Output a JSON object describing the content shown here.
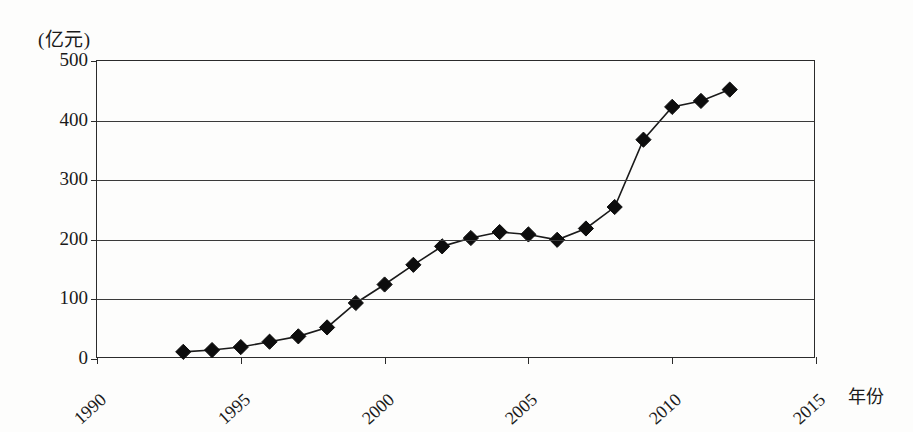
{
  "chart_data": {
    "type": "line",
    "title": "",
    "subtitle": "",
    "xlabel": "年份",
    "ylabel": "(亿元)",
    "y_unit_caption": "(亿元)",
    "xlim": [
      1990,
      2015
    ],
    "ylim": [
      0,
      500
    ],
    "grid": true,
    "legend": "none",
    "marker": "filled-diamond",
    "line_color": "#1a1a1a",
    "marker_color": "#0d0d0d",
    "x_ticks": [
      1990,
      1995,
      2000,
      2005,
      2010,
      2015
    ],
    "x_tick_labels": [
      "1990",
      "1995",
      "2000",
      "2005",
      "2010",
      "2015"
    ],
    "y_ticks": [
      0,
      100,
      200,
      300,
      400,
      500
    ],
    "y_tick_labels": [
      "0",
      "100",
      "200",
      "300",
      "400",
      "500"
    ],
    "x": [
      1993,
      1994,
      1995,
      1996,
      1997,
      1998,
      1999,
      2000,
      2001,
      2002,
      2003,
      2004,
      2005,
      2006,
      2007,
      2008,
      2009,
      2010,
      2011,
      2012
    ],
    "values": [
      12,
      15,
      20,
      29,
      38,
      53,
      94,
      125,
      158,
      189,
      203,
      213,
      209,
      200,
      219,
      255,
      368,
      423,
      433,
      452
    ],
    "series": [
      {
        "name": "",
        "x": [
          1993,
          1994,
          1995,
          1996,
          1997,
          1998,
          1999,
          2000,
          2001,
          2002,
          2003,
          2004,
          2005,
          2006,
          2007,
          2008,
          2009,
          2010,
          2011,
          2012
        ],
        "values": [
          12,
          15,
          20,
          29,
          38,
          53,
          94,
          125,
          158,
          189,
          203,
          213,
          209,
          200,
          219,
          255,
          368,
          423,
          433,
          452
        ]
      }
    ]
  }
}
